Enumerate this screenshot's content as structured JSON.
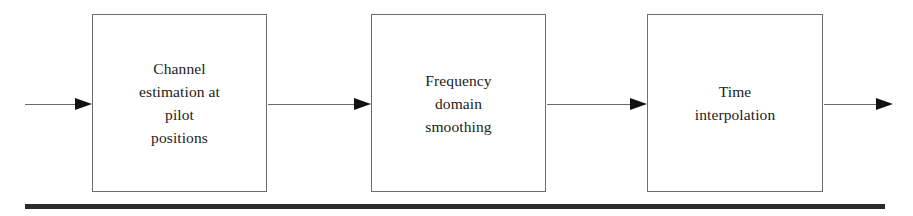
{
  "figure": {
    "type": "block-diagram",
    "orientation": "left-to-right",
    "background_color": "#ffffff",
    "box_border_color": "#6d6d6d",
    "text_color": "#1b1b1b",
    "arrow_color": "#6a6a6a",
    "arrow_head_color": "#111111",
    "rule_color": "#2b2b2b"
  },
  "blocks": [
    {
      "id": "channel-estimation",
      "label": "Channel\nestimation at\npilot\npositions",
      "lines": [
        "Channel",
        "estimation at",
        "pilot",
        "positions"
      ],
      "x": 92,
      "y": 14,
      "width": 175,
      "height": 178
    },
    {
      "id": "frequency-domain-smoothing",
      "label": "Frequency\ndomain\nsmoothing",
      "lines": [
        "Frequency",
        "domain",
        "smoothing"
      ],
      "x": 371,
      "y": 14,
      "width": 175,
      "height": 178
    },
    {
      "id": "time-interpolation",
      "label": "Time\ninterpolation",
      "lines": [
        "Time",
        "interpolation"
      ],
      "x": 647,
      "y": 14,
      "width": 176,
      "height": 178
    }
  ],
  "arrows": [
    {
      "id": "input-arrow",
      "name": "arrow-input-to-channel-estimation",
      "x": 25,
      "y": 98,
      "length": 67
    },
    {
      "id": "arrow-1-2",
      "name": "arrow-channel-estimation-to-smoothing",
      "x": 268,
      "y": 98,
      "length": 103
    },
    {
      "id": "arrow-2-3",
      "name": "arrow-smoothing-to-time-interpolation",
      "x": 547,
      "y": 98,
      "length": 100
    },
    {
      "id": "output-arrow",
      "name": "arrow-time-interpolation-to-output",
      "x": 824,
      "y": 98,
      "length": 69
    }
  ],
  "bottom_rule": {
    "x": 25,
    "y": 204,
    "width": 860,
    "height": 4.5
  }
}
